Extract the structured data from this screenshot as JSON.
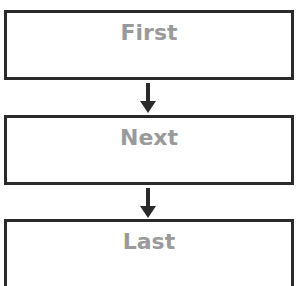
{
  "diagram": {
    "type": "flowchart",
    "direction": "top-to-bottom",
    "nodes": [
      {
        "id": "first",
        "label": "First"
      },
      {
        "id": "next",
        "label": "Next"
      },
      {
        "id": "last",
        "label": "Last"
      }
    ],
    "edges": [
      {
        "from": "first",
        "to": "next"
      },
      {
        "from": "next",
        "to": "last"
      }
    ],
    "colors": {
      "border": "#2a2a2a",
      "text": "#9a9a9a",
      "background": "#ffffff"
    }
  }
}
